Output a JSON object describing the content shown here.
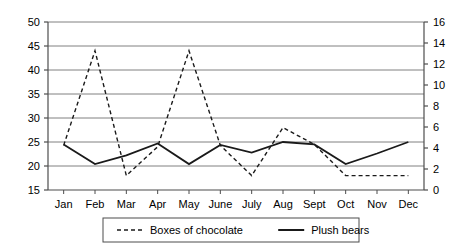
{
  "chart_data": {
    "type": "line",
    "title": "",
    "xlabel": "",
    "ylabel": "",
    "categories": [
      "Jan",
      "Feb",
      "Mar",
      "Apr",
      "May",
      "June",
      "July",
      "Aug",
      "Sept",
      "Oct",
      "Nov",
      "Dec"
    ],
    "left_axis": {
      "label": "",
      "ylim": [
        15,
        50
      ],
      "ticks": [
        15,
        20,
        25,
        30,
        35,
        40,
        45,
        50
      ],
      "tick_labels": [
        "15",
        "20",
        "25",
        "30",
        "35",
        "40",
        "45",
        "50"
      ]
    },
    "right_axis": {
      "label": "",
      "ylim": [
        0,
        16
      ],
      "ticks": [
        0,
        2,
        4,
        6,
        8,
        10,
        12,
        14,
        16
      ],
      "tick_labels": [
        "0",
        "2",
        "4",
        "6",
        "8",
        "10",
        "12",
        "14",
        "16"
      ]
    },
    "grid": true,
    "legend_position": "bottom",
    "series": [
      {
        "name": "Boxes of chocolate",
        "style": "dashed",
        "axis": "right",
        "color": "#1a1a1a",
        "values_left_scale": [
          24.3,
          44.0,
          18.0,
          24.0,
          44.0,
          24.3,
          18.0,
          28.0,
          24.5,
          18.0,
          18.0,
          18.0
        ],
        "values": [
          4.2,
          13.3,
          1.4,
          4.1,
          13.3,
          4.2,
          1.4,
          5.9,
          4.3,
          1.4,
          1.4,
          1.4
        ]
      },
      {
        "name": "Plush bears",
        "style": "solid",
        "axis": "left",
        "color": "#1a1a1a",
        "values": [
          24.5,
          20.4,
          22.2,
          24.7,
          20.4,
          24.4,
          22.8,
          25.0,
          24.5,
          20.4,
          22.6,
          25.0
        ]
      }
    ]
  },
  "legend": {
    "items": [
      {
        "label": "Boxes of chocolate",
        "style": "dashed"
      },
      {
        "label": "Plush bears",
        "style": "solid"
      }
    ]
  },
  "colors": {
    "line": "#1a1a1a",
    "grid": "#808080",
    "axis": "#4d4d4d",
    "background": "#ffffff",
    "legend_border": "#4d4d4d"
  }
}
